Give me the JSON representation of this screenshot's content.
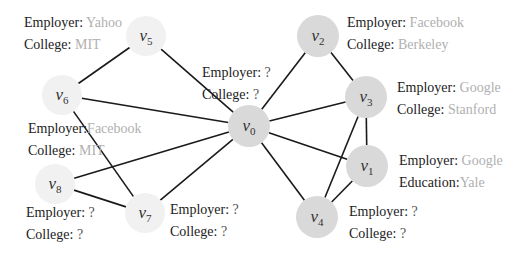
{
  "nodes": [
    {
      "id": "v0",
      "name": "v",
      "sub": "0",
      "x": 249,
      "y": 126,
      "r": 21,
      "shade": "dark"
    },
    {
      "id": "v1",
      "name": "v",
      "sub": "1",
      "x": 367,
      "y": 166,
      "r": 21,
      "shade": "dark"
    },
    {
      "id": "v2",
      "name": "v",
      "sub": "2",
      "x": 318,
      "y": 36,
      "r": 21,
      "shade": "dark"
    },
    {
      "id": "v3",
      "name": "v",
      "sub": "3",
      "x": 366,
      "y": 97,
      "r": 21,
      "shade": "dark"
    },
    {
      "id": "v4",
      "name": "v",
      "sub": "4",
      "x": 317,
      "y": 217,
      "r": 21,
      "shade": "dark"
    },
    {
      "id": "v5",
      "name": "v",
      "sub": "5",
      "x": 146,
      "y": 36,
      "r": 20,
      "shade": "light"
    },
    {
      "id": "v6",
      "name": "v",
      "sub": "6",
      "x": 62,
      "y": 95,
      "r": 20,
      "shade": "light"
    },
    {
      "id": "v7",
      "name": "v",
      "sub": "7",
      "x": 145,
      "y": 213,
      "r": 20,
      "shade": "light"
    },
    {
      "id": "v8",
      "name": "v",
      "sub": "8",
      "x": 55,
      "y": 184,
      "r": 20,
      "shade": "light"
    }
  ],
  "edges": [
    [
      "v5",
      "v6"
    ],
    [
      "v5",
      "v0"
    ],
    [
      "v6",
      "v0"
    ],
    [
      "v6",
      "v7"
    ],
    [
      "v8",
      "v0"
    ],
    [
      "v8",
      "v7"
    ],
    [
      "v7",
      "v0"
    ],
    [
      "v0",
      "v2"
    ],
    [
      "v0",
      "v3"
    ],
    [
      "v0",
      "v1"
    ],
    [
      "v0",
      "v4"
    ],
    [
      "v2",
      "v3"
    ],
    [
      "v3",
      "v1"
    ],
    [
      "v3",
      "v4"
    ],
    [
      "v1",
      "v4"
    ]
  ],
  "labels": {
    "v0": {
      "line1_key": "Employer:",
      "line1_val": "?",
      "line2_key": "College:",
      "line2_val": "?"
    },
    "v1": {
      "line1_key": "Employer:",
      "line1_val": "Google",
      "line2_key": "Education:",
      "line2_val": "Yale"
    },
    "v2": {
      "line1_key": "Employer:",
      "line1_val": "Facebook",
      "line2_key": "College:",
      "line2_val": "Berkeley"
    },
    "v3": {
      "line1_key": "Employer:",
      "line1_val": "Google",
      "line2_key": "College:",
      "line2_val": "Stanford"
    },
    "v4": {
      "line1_key": "Employer:",
      "line1_val": "?",
      "line2_key": "College:",
      "line2_val": "?"
    },
    "v5": {
      "line1_key": "Employer:",
      "line1_val": "Yahoo",
      "line2_key": "College:",
      "line2_val": "MIT"
    },
    "v6": {
      "line1_key": "Employer:",
      "line1_val": "Facebook",
      "line2_key": "College:",
      "line2_val": "MIT"
    },
    "v7": {
      "line1_key": "Employer:",
      "line1_val": "?",
      "line2_key": "College:",
      "line2_val": "?"
    },
    "v8": {
      "line1_key": "Employer:",
      "line1_val": "?",
      "line2_key": "College:",
      "line2_val": "?"
    }
  },
  "colors": {
    "edge": "#1a1a1a",
    "node_dark": "#d9d9d9",
    "node_light": "#f1f1f1",
    "known_value": "#b0b0b0"
  }
}
